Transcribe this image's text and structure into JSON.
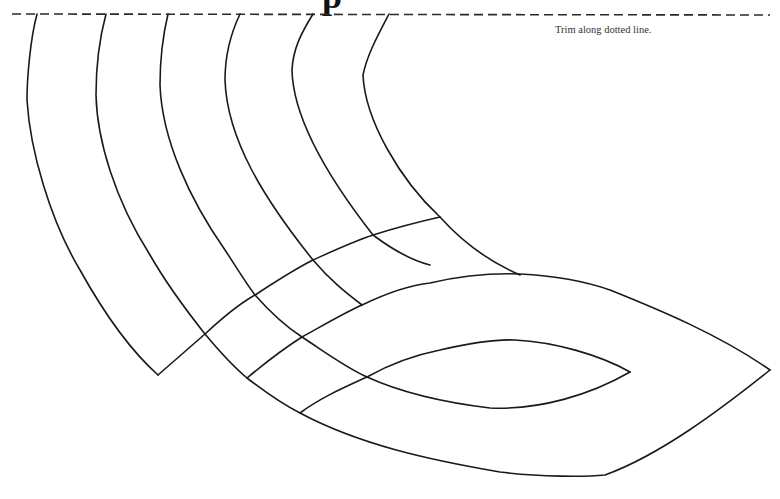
{
  "page": {
    "title_fragment": "p",
    "trim_instruction": "Trim along dotted line."
  },
  "template": {
    "type": "mask-cutout-pattern",
    "line_color": "#1a1a1a",
    "background": "#ffffff",
    "strips_count": 5,
    "cross_bands_count": 3,
    "has_eye_hole": true
  }
}
